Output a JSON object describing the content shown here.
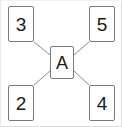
{
  "figure": {
    "type": "node-link-diagram",
    "background_color": "#ffffff",
    "frame_color": "#dcdcdc",
    "node_border_color": "#7a7a7a",
    "edge_color": "#8c8c8c",
    "text_color": "#1a1a1a"
  },
  "nodes": {
    "center": {
      "label": "A",
      "position": "center"
    },
    "top_left": {
      "label": "3",
      "position": "top-left"
    },
    "top_right": {
      "label": "5",
      "position": "top-right"
    },
    "bottom_left": {
      "label": "2",
      "position": "bottom-left"
    },
    "bottom_right": {
      "label": "4",
      "position": "bottom-right"
    }
  },
  "edges": [
    {
      "from": "3",
      "to": "A"
    },
    {
      "from": "5",
      "to": "A"
    },
    {
      "from": "2",
      "to": "A"
    },
    {
      "from": "4",
      "to": "A"
    }
  ]
}
